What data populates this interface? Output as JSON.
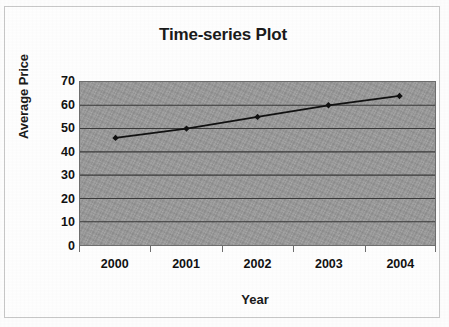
{
  "chart_data": {
    "type": "line",
    "title": "Time-series Plot",
    "xlabel": "Year",
    "ylabel": "Average Price",
    "categories": [
      "2000",
      "2001",
      "2002",
      "2003",
      "2004"
    ],
    "values": [
      46,
      50,
      55,
      60,
      64
    ],
    "series": [
      {
        "name": "Average Price",
        "values": [
          46,
          50,
          55,
          60,
          64
        ]
      }
    ],
    "ylim": [
      0,
      70
    ],
    "y_ticks": [
      70,
      60,
      50,
      40,
      30,
      20,
      10,
      0
    ],
    "y_tick_labels": [
      "70",
      "60",
      "50",
      "40",
      "30",
      "20",
      "10",
      "0"
    ],
    "x_tick_labels": [
      "2000",
      "2001",
      "2002",
      "2003",
      "2004"
    ],
    "grid": "horizontal",
    "legend": "none",
    "marker": "diamond",
    "colors": {
      "line": "#111111",
      "marker": "#111111",
      "plot_background": "#9c9c9c",
      "gridline": "#3a3a3a",
      "axis": "#6f6f6f",
      "text": "#111111",
      "page_background": "#ffffff",
      "frame_border": "#c9c9c9"
    }
  }
}
